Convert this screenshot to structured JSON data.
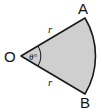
{
  "diagram": {
    "points": {
      "center": "O",
      "top": "A",
      "bottom": "B"
    },
    "radius_label_top": "r",
    "radius_label_bottom": "r",
    "angle_label": "θ°",
    "colors": {
      "fill": "#cfcfcf",
      "stroke": "#1a1a1a"
    }
  }
}
